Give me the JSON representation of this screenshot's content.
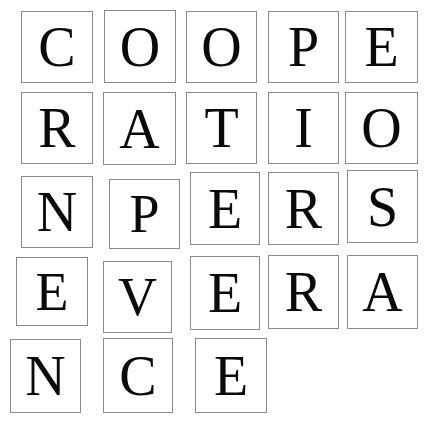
{
  "image": {
    "kind": "letter-tile-grid",
    "phrase": "COOPERATION PERSEVERANCE",
    "words": [
      "COOPERATION",
      "PERSEVERANCE"
    ],
    "background_color": "#ffffff",
    "tile_background_color": "#ffffff",
    "tile_border_color": "#8b8b8b",
    "letter_color": "#0a0a0a",
    "rows": 5,
    "columns": 5,
    "tile_count": 23
  },
  "rows": [
    {
      "index": 1,
      "text": "COOPE"
    },
    {
      "index": 2,
      "text": "RATIO"
    },
    {
      "index": 3,
      "text": "NPERS"
    },
    {
      "index": 4,
      "text": "EVERA"
    },
    {
      "index": 5,
      "text": "NCE"
    }
  ],
  "tiles": [
    {
      "id": "r1c1",
      "letter": "C",
      "row": 1,
      "col": 1,
      "x": 21,
      "y": 11,
      "w": 72,
      "h": 72,
      "font_size": 56
    },
    {
      "id": "r1c2",
      "letter": "O",
      "row": 1,
      "col": 2,
      "x": 104,
      "y": 10,
      "w": 72,
      "h": 73,
      "font_size": 56
    },
    {
      "id": "r1c3",
      "letter": "O",
      "row": 1,
      "col": 3,
      "x": 186,
      "y": 11,
      "w": 71,
      "h": 72,
      "font_size": 56
    },
    {
      "id": "r1c4",
      "letter": "P",
      "row": 1,
      "col": 4,
      "x": 268,
      "y": 11,
      "w": 71,
      "h": 72,
      "font_size": 56
    },
    {
      "id": "r1c5",
      "letter": "E",
      "row": 1,
      "col": 5,
      "x": 345,
      "y": 11,
      "w": 73,
      "h": 72,
      "font_size": 56
    },
    {
      "id": "r2c1",
      "letter": "R",
      "row": 2,
      "col": 1,
      "x": 21,
      "y": 92,
      "w": 72,
      "h": 72,
      "font_size": 56
    },
    {
      "id": "r2c2",
      "letter": "A",
      "row": 2,
      "col": 2,
      "x": 103,
      "y": 92,
      "w": 73,
      "h": 73,
      "font_size": 56
    },
    {
      "id": "r2c3",
      "letter": "T",
      "row": 2,
      "col": 3,
      "x": 186,
      "y": 92,
      "w": 71,
      "h": 72,
      "font_size": 56
    },
    {
      "id": "r2c4",
      "letter": "I",
      "row": 2,
      "col": 4,
      "x": 268,
      "y": 92,
      "w": 71,
      "h": 72,
      "font_size": 56
    },
    {
      "id": "r2c5",
      "letter": "O",
      "row": 2,
      "col": 5,
      "x": 345,
      "y": 92,
      "w": 73,
      "h": 72,
      "font_size": 56
    },
    {
      "id": "r3c1",
      "letter": "N",
      "row": 3,
      "col": 1,
      "x": 21,
      "y": 176,
      "w": 72,
      "h": 72,
      "font_size": 56
    },
    {
      "id": "r3c2",
      "letter": "P",
      "row": 3,
      "col": 2,
      "x": 109,
      "y": 179,
      "w": 71,
      "h": 70,
      "font_size": 54
    },
    {
      "id": "r3c3",
      "letter": "E",
      "row": 3,
      "col": 3,
      "x": 190,
      "y": 172,
      "w": 70,
      "h": 73,
      "font_size": 56
    },
    {
      "id": "r3c4",
      "letter": "R",
      "row": 3,
      "col": 4,
      "x": 268,
      "y": 172,
      "w": 71,
      "h": 73,
      "font_size": 56
    },
    {
      "id": "r3c5",
      "letter": "S",
      "row": 3,
      "col": 5,
      "x": 347,
      "y": 170,
      "w": 71,
      "h": 73,
      "font_size": 56
    },
    {
      "id": "r4c1",
      "letter": "E",
      "row": 4,
      "col": 1,
      "x": 16,
      "y": 257,
      "w": 72,
      "h": 69,
      "font_size": 54
    },
    {
      "id": "r4c2",
      "letter": "V",
      "row": 4,
      "col": 2,
      "x": 103,
      "y": 261,
      "w": 69,
      "h": 72,
      "font_size": 54
    },
    {
      "id": "r4c3",
      "letter": "E",
      "row": 4,
      "col": 3,
      "x": 190,
      "y": 256,
      "w": 70,
      "h": 74,
      "font_size": 56
    },
    {
      "id": "r4c4",
      "letter": "R",
      "row": 4,
      "col": 4,
      "x": 268,
      "y": 255,
      "w": 71,
      "h": 74,
      "font_size": 56
    },
    {
      "id": "r4c5",
      "letter": "A",
      "row": 4,
      "col": 5,
      "x": 347,
      "y": 255,
      "w": 71,
      "h": 74,
      "font_size": 56
    },
    {
      "id": "r5c1",
      "letter": "N",
      "row": 5,
      "col": 1,
      "x": 10,
      "y": 339,
      "w": 71,
      "h": 74,
      "font_size": 56
    },
    {
      "id": "r5c2",
      "letter": "C",
      "row": 5,
      "col": 2,
      "x": 103,
      "y": 338,
      "w": 70,
      "h": 75,
      "font_size": 56
    },
    {
      "id": "r5c3",
      "letter": "E",
      "row": 5,
      "col": 3,
      "x": 195,
      "y": 338,
      "w": 72,
      "h": 75,
      "font_size": 56
    }
  ]
}
